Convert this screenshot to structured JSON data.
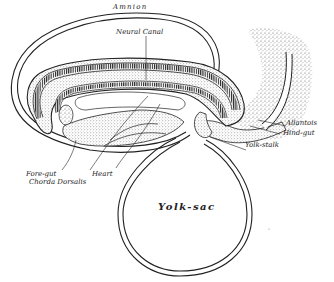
{
  "diagram": {
    "labels": {
      "amnion": "Amnion",
      "neural_canal": "Neural Canal",
      "allantois": "Allantois",
      "hind_gut": "Hind-gut",
      "yolk_stalk": "Yolk-stalk",
      "fore_gut": "Fore-gut",
      "chorda_dorsalis": "Chorda Dorsalis",
      "heart": "Heart",
      "yolk_sac": "Yolk-sac"
    },
    "colors": {
      "ink": "#222222",
      "stipple": "#6a6a6a",
      "background": "#ffffff"
    }
  }
}
